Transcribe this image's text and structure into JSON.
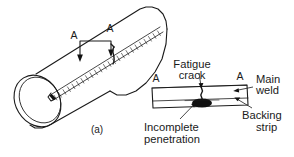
{
  "figure": {
    "caption": "(a)",
    "domain_kind": "engineering-diagram",
    "line_color": "#1a1a1a",
    "background_color": "#ffffff"
  },
  "pipe_view": {
    "name": "isometric welded pipe",
    "section_letter_left": "A",
    "section_letter_right": "A",
    "caption": "(a)",
    "features": [
      "longitudinal seam weld",
      "section cutting plane A-A",
      "pipe open end showing wall thickness"
    ]
  },
  "section_view": {
    "name": "Section A-A through weld",
    "section_letter_left": "A",
    "section_letter_right": "A",
    "labels": {
      "fatigue_crack": "Fatigue\ncrack",
      "fatigue_crack_line1": "Fatigue",
      "fatigue_crack_line2": "crack",
      "main_weld_line1": "Main",
      "main_weld_line2": "weld",
      "backing_strip_line1": "Backing",
      "backing_strip_line2": "strip",
      "incomplete_penetration_line1": "Incomplete",
      "incomplete_penetration_line2": "penetration"
    }
  },
  "annotations": [
    {
      "id": "fatigue-crack",
      "text": "Fatigue crack"
    },
    {
      "id": "main-weld",
      "text": "Main weld"
    },
    {
      "id": "backing-strip",
      "text": "Backing strip"
    },
    {
      "id": "incomplete-penetration",
      "text": "Incomplete penetration"
    },
    {
      "id": "section-a-left",
      "text": "A"
    },
    {
      "id": "section-a-right",
      "text": "A"
    },
    {
      "id": "pipe-section-a-left",
      "text": "A"
    },
    {
      "id": "pipe-section-a-right",
      "text": "A"
    },
    {
      "id": "caption",
      "text": "(a)"
    }
  ]
}
